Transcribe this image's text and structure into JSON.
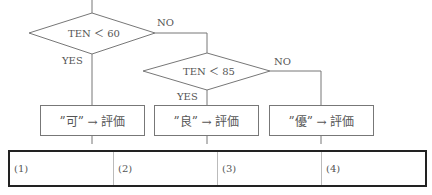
{
  "flowchart": {
    "decisions": [
      {
        "id": "d1",
        "condition": "TEN ＜ 60",
        "yes_label": "YES",
        "no_label": "NO"
      },
      {
        "id": "d2",
        "condition": "TEN ＜ 85",
        "yes_label": "YES",
        "no_label": "NO"
      }
    ],
    "processes": [
      {
        "id": "p1",
        "text": "”可” → 評価"
      },
      {
        "id": "p2",
        "text": "”良” → 評価"
      },
      {
        "id": "p3",
        "text": "”優” → 評価"
      }
    ],
    "line_color": "#777777"
  },
  "answer_table": {
    "cells": [
      "(1)",
      "(2)",
      "(3)",
      "(4)"
    ],
    "border_color": "#222222"
  }
}
